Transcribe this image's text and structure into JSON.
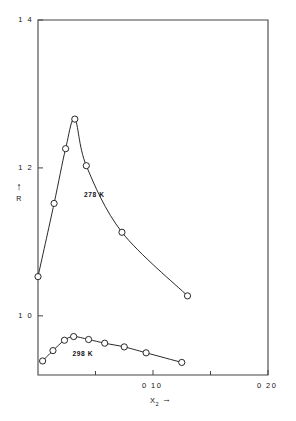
{
  "chart_data": {
    "type": "line",
    "title": "",
    "xlabel": "X2",
    "xlabel_display": "X",
    "xlabel_sub": "2",
    "ylabel": "R",
    "xlim": [
      0,
      0.2
    ],
    "ylim": [
      0.92,
      1.4
    ],
    "grid": false,
    "legend_position": "inline-annotation",
    "x_tick_labels": [
      "0 10",
      "0 20"
    ],
    "x_tick_values": [
      0.1,
      0.2
    ],
    "x_minor_tick_values": [
      0.05,
      0.15
    ],
    "y_tick_labels": [
      "1 0",
      "1 2",
      "1 4"
    ],
    "y_tick_values": [
      1.0,
      1.2,
      1.4
    ],
    "marker": "open-circle",
    "series": [
      {
        "name": "278 K",
        "label": "278 K",
        "color": "#111111",
        "x": [
          0.0,
          0.014,
          0.024,
          0.032,
          0.042,
          0.073,
          0.13
        ],
        "y": [
          1.053,
          1.152,
          1.226,
          1.266,
          1.203,
          1.113,
          1.027
        ]
      },
      {
        "name": "298 K",
        "label": "298 K",
        "color": "#111111",
        "x": [
          0.004,
          0.013,
          0.023,
          0.031,
          0.044,
          0.058,
          0.075,
          0.094,
          0.125
        ],
        "y": [
          0.939,
          0.953,
          0.967,
          0.972,
          0.968,
          0.963,
          0.958,
          0.95,
          0.937
        ]
      }
    ],
    "annotations": [
      {
        "text": "278 K",
        "x": 0.04,
        "y": 1.163
      },
      {
        "text": "298 K",
        "x": 0.03,
        "y": 0.949
      }
    ]
  },
  "axis_labels": {
    "y_axis_arrow": "↑",
    "y_axis_name": "R",
    "x_axis_arrow": "→"
  }
}
